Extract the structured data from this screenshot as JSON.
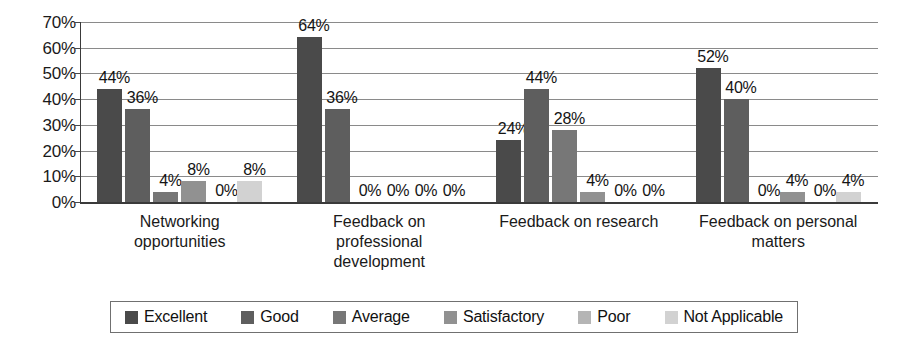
{
  "chart_data": {
    "type": "bar",
    "title": "",
    "subtitle": "",
    "xlabel": "",
    "ylabel": "",
    "ylim": [
      0,
      70
    ],
    "ytick_labels": [
      "0%",
      "10%",
      "20%",
      "30%",
      "40%",
      "50%",
      "60%",
      "70%"
    ],
    "ytick_values": [
      0,
      10,
      20,
      30,
      40,
      50,
      60,
      70
    ],
    "grid": true,
    "legend_position": "bottom",
    "value_suffix": "%",
    "categories": [
      "Networking opportunities",
      "Feedback on professional development",
      "Feedback on research",
      "Feedback on personal matters"
    ],
    "category_lines": [
      [
        "Networking",
        "opportunities"
      ],
      [
        "Feedback on",
        "professional",
        "development"
      ],
      [
        "Feedback on research"
      ],
      [
        "Feedback on personal",
        "matters"
      ]
    ],
    "series": [
      {
        "name": "Excellent",
        "color": "#4a4a4a",
        "values": [
          44,
          64,
          24,
          52
        ],
        "labels": [
          "44%",
          "64%",
          "24%",
          "52%"
        ]
      },
      {
        "name": "Good",
        "color": "#5e5e5e",
        "values": [
          36,
          36,
          44,
          40
        ],
        "labels": [
          "36%",
          "36%",
          "44%",
          "40%"
        ]
      },
      {
        "name": "Average",
        "color": "#777777",
        "values": [
          4,
          0,
          28,
          0
        ],
        "labels": [
          "4%",
          "0%",
          "28%",
          "0%"
        ]
      },
      {
        "name": "Satisfactory",
        "color": "#919191",
        "values": [
          8,
          0,
          4,
          4
        ],
        "labels": [
          "8%",
          "0%",
          "4%",
          "4%"
        ]
      },
      {
        "name": "Poor",
        "color": "#b5b5b5",
        "values": [
          0,
          0,
          0,
          0
        ],
        "labels": [
          "0%",
          "0%",
          "0%",
          "0%"
        ]
      },
      {
        "name": "Not Applicable",
        "color": "#d2d2d2",
        "values": [
          8,
          0,
          0,
          4
        ],
        "labels": [
          "8%",
          "0%",
          "0%",
          "4%"
        ]
      }
    ]
  },
  "legend": {
    "items": [
      {
        "label": "Excellent",
        "color": "#4a4a4a"
      },
      {
        "label": "Good",
        "color": "#5e5e5e"
      },
      {
        "label": "Average",
        "color": "#777777"
      },
      {
        "label": "Satisfactory",
        "color": "#919191"
      },
      {
        "label": "Poor",
        "color": "#b5b5b5"
      },
      {
        "label": "Not Applicable",
        "color": "#d2d2d2"
      }
    ]
  }
}
